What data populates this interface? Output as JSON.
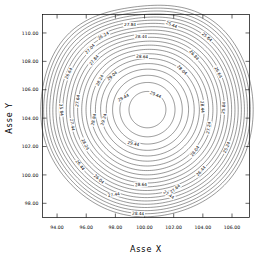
{
  "figure": {
    "background_color": "#ffffff",
    "line_color": "#1a1a1a",
    "text_color": "#000000"
  },
  "axes": {
    "x_title": "Asse X",
    "y_title": "Asse Y"
  },
  "chart_data": {
    "type": "contour",
    "title": "",
    "xlabel": "Asse X",
    "ylabel": "Asse Y",
    "xlim": [
      93.0,
      107.2
    ],
    "ylim": [
      97.0,
      111.3
    ],
    "xticks": [
      94.0,
      96.0,
      98.0,
      100.0,
      102.0,
      104.0,
      106.0
    ],
    "yticks": [
      98.0,
      100.0,
      102.0,
      104.0,
      106.0,
      108.0,
      110.0
    ],
    "xtick_labels": [
      "94.00",
      "96.00",
      "98.00",
      "100.00",
      "102.00",
      "104.00",
      "106.00"
    ],
    "ytick_labels": [
      "98.00",
      "100.00",
      "102.00",
      "104.00",
      "106.00",
      "108.00",
      "110.00"
    ],
    "grid": false,
    "legend": false,
    "colormap": "monochrome",
    "center": {
      "x": 100.2,
      "y": 104.6
    },
    "peak_value": 29.44,
    "contour_interval": 0.2,
    "n_levels": 22,
    "levels": [
      29.44,
      29.24,
      29.04,
      28.84,
      28.64,
      28.44,
      28.24,
      28.04,
      27.84,
      27.64,
      27.44,
      27.24,
      27.04,
      26.84,
      26.64,
      26.44,
      26.24,
      26.04,
      25.84,
      25.64,
      25.44,
      25.24
    ],
    "level_labels": [
      "29.44",
      "29.24",
      "29.04",
      "28.84",
      "28.64",
      "28.44",
      "28.24",
      "28.04",
      "27.84",
      "27.64",
      "27.44",
      "27.24",
      "27.04",
      "26.84",
      "26.64",
      "26.44",
      "26.24",
      "26.04",
      "25.84",
      "25.64",
      "25.44",
      "25.24"
    ]
  },
  "contour_labels": [
    {
      "text": "29.44",
      "x": 124,
      "y": 99,
      "rot": -28
    },
    {
      "text": "29.44",
      "x": 155,
      "y": 96,
      "rot": 22
    },
    {
      "text": "29.44",
      "x": 133,
      "y": 145,
      "rot": 12
    },
    {
      "text": "29.24",
      "x": 105,
      "y": 120,
      "rot": -72
    },
    {
      "text": "29.04",
      "x": 113,
      "y": 77,
      "rot": -40
    },
    {
      "text": "28.84",
      "x": 95,
      "y": 120,
      "rot": -78
    },
    {
      "text": "28.64",
      "x": 142,
      "y": 58,
      "rot": 4
    },
    {
      "text": "28.64",
      "x": 141,
      "y": 186,
      "rot": -2
    },
    {
      "text": "28.44",
      "x": 141,
      "y": 38,
      "rot": 2
    },
    {
      "text": "28.44",
      "x": 201,
      "y": 107,
      "rot": 86
    },
    {
      "text": "28.44",
      "x": 138,
      "y": 215,
      "rot": 3
    },
    {
      "text": "28.24",
      "x": 101,
      "y": 81,
      "rot": -62
    },
    {
      "text": "28.24",
      "x": 84,
      "y": 145,
      "rot": 62
    },
    {
      "text": "28.04",
      "x": 181,
      "y": 71,
      "rot": 44
    },
    {
      "text": "28.04",
      "x": 196,
      "y": 152,
      "rot": -54
    },
    {
      "text": "27.84",
      "x": 130,
      "y": 26,
      "rot": 1
    },
    {
      "text": "27.84",
      "x": 95,
      "y": 61,
      "rot": -50
    },
    {
      "text": "27.64",
      "x": 79,
      "y": 101,
      "rot": -82
    },
    {
      "text": "27.64",
      "x": 176,
      "y": 190,
      "rot": -40
    },
    {
      "text": "27.44",
      "x": 71,
      "y": 125,
      "rot": 80
    },
    {
      "text": "27.44",
      "x": 114,
      "y": 196,
      "rot": -8
    },
    {
      "text": "27.44",
      "x": 168,
      "y": 196,
      "rot": 32
    },
    {
      "text": "27.24",
      "x": 210,
      "y": 128,
      "rot": -80
    },
    {
      "text": "27.04",
      "x": 91,
      "y": 50,
      "rot": -46
    },
    {
      "text": "26.84",
      "x": 193,
      "y": 56,
      "rot": 48
    },
    {
      "text": "26.64",
      "x": 70,
      "y": 74,
      "rot": -64
    },
    {
      "text": "26.64",
      "x": 217,
      "y": 73,
      "rot": 62
    },
    {
      "text": "26.44",
      "x": 79,
      "y": 166,
      "rot": 52
    },
    {
      "text": "26.44",
      "x": 202,
      "y": 172,
      "rot": -48
    },
    {
      "text": "26.24",
      "x": 104,
      "y": 37,
      "rot": -30
    },
    {
      "text": "26.04",
      "x": 98,
      "y": 180,
      "rot": 42
    },
    {
      "text": "25.84",
      "x": 60,
      "y": 110,
      "rot": 84
    },
    {
      "text": "25.84",
      "x": 225,
      "y": 108,
      "rot": -84
    },
    {
      "text": "25.64",
      "x": 206,
      "y": 38,
      "rot": 40
    },
    {
      "text": "25.44",
      "x": 171,
      "y": 26,
      "rot": 22
    },
    {
      "text": "25.24",
      "x": 228,
      "y": 148,
      "rot": -66
    }
  ]
}
